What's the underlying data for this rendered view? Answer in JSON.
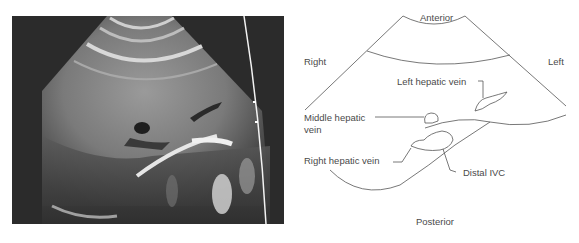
{
  "figure": {
    "ultrasound_panel": {
      "description": "Grayscale transverse ultrasound image of liver showing hepatic veins and distal IVC",
      "colors": {
        "background": "#2b2b2b",
        "tissue": "#8a8a8a",
        "bright_echo": "#e6e6e6",
        "border_line": "#f2f2f2"
      }
    },
    "diagram_panel": {
      "labels": {
        "anterior": "Anterior",
        "posterior": "Posterior",
        "right": "Right",
        "left": "Left",
        "left_hepatic_vein": "Left hepatic vein",
        "middle_hepatic_vein_line1": "Middle hepatic",
        "middle_hepatic_vein_line2": "vein",
        "right_hepatic_vein": "Right hepatic vein",
        "distal_ivc": "Distal IVC"
      },
      "colors": {
        "line": "#555555",
        "text": "#4a4a4a"
      }
    }
  }
}
